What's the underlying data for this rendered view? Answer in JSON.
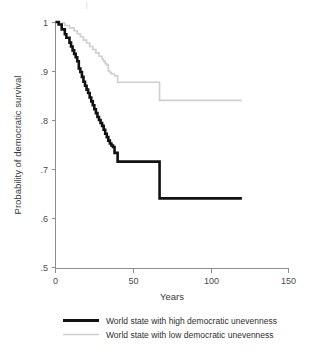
{
  "chart_data": {
    "type": "line",
    "subtype": "kaplan-meier-step",
    "title": "",
    "xlabel": "Years",
    "ylabel": "Probability of democratic survival",
    "xlim": [
      0,
      150
    ],
    "ylim": [
      0.5,
      1.0
    ],
    "xticks": [
      0,
      50,
      100,
      150
    ],
    "xtick_labels": [
      "0",
      "50",
      "100",
      "150"
    ],
    "yticks": [
      0.5,
      0.6,
      0.7,
      0.8,
      0.9,
      1.0
    ],
    "ytick_labels": [
      ".5",
      ".6",
      ".7",
      ".8",
      ".9",
      "1"
    ],
    "grid": false,
    "legend_position": "bottom",
    "series": [
      {
        "name": "World state with high democratic unevenness",
        "color": "#111111",
        "line_width": 2.6,
        "x": [
          0,
          2,
          4,
          6,
          7,
          9,
          10,
          11,
          12,
          13,
          14,
          15,
          16,
          17,
          18,
          19,
          20,
          21,
          22,
          23,
          24,
          25,
          26,
          27,
          28,
          29,
          30,
          31,
          32,
          33,
          34,
          35,
          36,
          37,
          38,
          40,
          67,
          120
        ],
        "y": [
          1.0,
          0.995,
          0.985,
          0.975,
          0.968,
          0.958,
          0.95,
          0.942,
          0.935,
          0.928,
          0.92,
          0.905,
          0.898,
          0.888,
          0.878,
          0.87,
          0.862,
          0.855,
          0.846,
          0.838,
          0.83,
          0.822,
          0.814,
          0.806,
          0.8,
          0.794,
          0.788,
          0.78,
          0.772,
          0.765,
          0.758,
          0.752,
          0.748,
          0.745,
          0.733,
          0.715,
          0.64,
          0.64
        ]
      },
      {
        "name": "World state with low democratic unevenness",
        "color": "#cfcfcf",
        "line_width": 1.6,
        "x": [
          0,
          3,
          6,
          9,
          12,
          14,
          16,
          18,
          20,
          22,
          24,
          26,
          28,
          30,
          31,
          32,
          33,
          34,
          35,
          36,
          38,
          40,
          67,
          120
        ],
        "y": [
          1.0,
          0.998,
          0.993,
          0.988,
          0.982,
          0.976,
          0.97,
          0.963,
          0.957,
          0.95,
          0.944,
          0.937,
          0.93,
          0.924,
          0.92,
          0.915,
          0.912,
          0.9,
          0.897,
          0.894,
          0.89,
          0.877,
          0.84,
          0.84
        ]
      }
    ],
    "annotations": []
  },
  "legend": {
    "items": [
      {
        "label": "World state with high democratic unevenness",
        "color": "#111111",
        "weight": "thick"
      },
      {
        "label": "World state with low democratic unevenness",
        "color": "#cfcfcf",
        "weight": "thin"
      }
    ]
  },
  "axes": {
    "x_title": "Years",
    "y_title": "Probability of democratic survival"
  }
}
